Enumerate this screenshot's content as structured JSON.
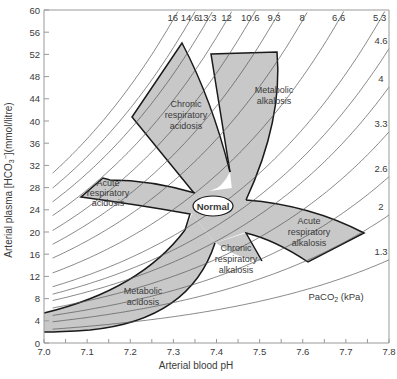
{
  "chart_data": {
    "type": "area",
    "title": "",
    "xlabel": "Arterial blood pH",
    "ylabel": "Arterial plasma [HCO3-](mmol/litre)",
    "xlim": [
      7.0,
      7.8
    ],
    "ylim": [
      0,
      60
    ],
    "x_ticks": [
      "7.0",
      "7.1",
      "7.2",
      "7.3",
      "7.4",
      "7.5",
      "7.6",
      "7.7",
      "7.8"
    ],
    "y_ticks": [
      "0",
      "4",
      "8",
      "12",
      "16",
      "20",
      "24",
      "28",
      "32",
      "36",
      "40",
      "44",
      "48",
      "52",
      "56",
      "60"
    ],
    "grid": false,
    "isopleth_title": "PaCO2 (kPa)",
    "isopleths_kpa": [
      "16",
      "14.6",
      "13.3",
      "12",
      "10.6",
      "9.3",
      "8",
      "6.6",
      "5.3",
      "4.6",
      "4",
      "3.3",
      "2.6",
      "2",
      "1.3"
    ],
    "regions": [
      {
        "name": "Normal",
        "center_pH": 7.4,
        "center_HCO3": 24
      },
      {
        "name": "Chronic respiratory acidosis",
        "approx_pH": [
          7.21,
          7.43
        ],
        "approx_HCO3": [
          27,
          54
        ]
      },
      {
        "name": "Acute respiratory acidosis",
        "approx_pH": [
          7.09,
          7.35
        ],
        "approx_HCO3": [
          23,
          30
        ]
      },
      {
        "name": "Metabolic alkalosis",
        "approx_pH": [
          7.43,
          7.62
        ],
        "approx_HCO3": [
          31,
          55
        ]
      },
      {
        "name": "Acute respiratory alkalosis",
        "approx_pH": [
          7.46,
          7.74
        ],
        "approx_HCO3": [
          15,
          26
        ]
      },
      {
        "name": "Chronic respiratory alkalosis",
        "approx_pH": [
          7.39,
          7.5
        ],
        "approx_HCO3": [
          14,
          20
        ]
      },
      {
        "name": "Metabolic acidosis",
        "approx_pH": [
          7.0,
          7.4
        ],
        "approx_HCO3": [
          2,
          22
        ]
      }
    ]
  },
  "labels": {
    "xlabel": "Arterial blood pH",
    "ylabel": "Arterial plasma [HCO",
    "ylabel_sub": "3",
    "ylabel_sup": "−",
    "ylabel_end": "](mmol/litre)",
    "paco2_main": "PaCO",
    "paco2_sub": "2",
    "paco2_end": " (kPa)",
    "normal": "Normal",
    "chronic_resp_acidosis": [
      "Chronic",
      "respiratory",
      "acidosis"
    ],
    "acute_resp_acidosis": [
      "Acute",
      "respiratory",
      "acidosis"
    ],
    "metabolic_alkalosis": [
      "Metabolic",
      "alkalosis"
    ],
    "acute_resp_alkalosis": [
      "Acute",
      "respiratory",
      "alkalosis"
    ],
    "chronic_resp_alkalosis": [
      "Chronic",
      "respiratory",
      "alkalosis"
    ],
    "metabolic_acidosis": [
      "Metabolic",
      "acidosis"
    ]
  },
  "colors": {
    "region_fill": "#c8c8c8",
    "region_stroke": "#1a1a1a",
    "isopleth": "#555555",
    "axis": "#888888",
    "text": "#3a3a3a"
  }
}
